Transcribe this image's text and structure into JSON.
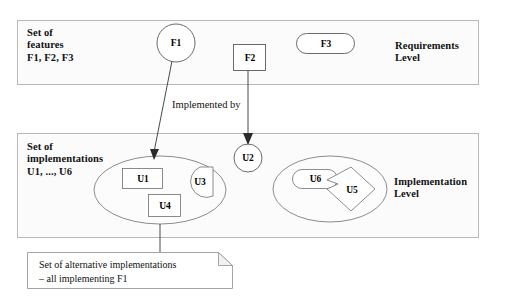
{
  "diagram": {
    "colors": {
      "panel_fill": "#fbfbfb",
      "panel_stroke": "#b8b8b8",
      "shape_stroke": "#5a5a5a",
      "connector": "#4a4a4a",
      "text": "#111111",
      "note_fill": "#ffffff",
      "note_stroke": "#9a9a9a"
    },
    "panels": [
      {
        "id": "requirements",
        "side_label": "Set of\nfeatures\nF1, F2, F3",
        "level_label": "Requirements\nLevel"
      },
      {
        "id": "implementation",
        "side_label": "Set of\nimplementations\nU1, ..., U6",
        "level_label": "Implementation\nLevel"
      }
    ],
    "features": [
      {
        "id": "F1",
        "label": "F1",
        "shape": "circle"
      },
      {
        "id": "F2",
        "label": "F2",
        "shape": "rectangle"
      },
      {
        "id": "F3",
        "label": "F3",
        "shape": "rounded-rectangle"
      }
    ],
    "implementations": [
      {
        "id": "U1",
        "label": "U1",
        "shape": "rectangle"
      },
      {
        "id": "U2",
        "label": "U2",
        "shape": "circle"
      },
      {
        "id": "U3",
        "label": "U3",
        "shape": "cut-circle"
      },
      {
        "id": "U4",
        "label": "U4",
        "shape": "rectangle"
      },
      {
        "id": "U5",
        "label": "U5",
        "shape": "notched-diamond"
      },
      {
        "id": "U6",
        "label": "U6",
        "shape": "rounded-rectangle"
      }
    ],
    "groups": [
      {
        "id": "group-left",
        "members": [
          "U1",
          "U3",
          "U4"
        ]
      },
      {
        "id": "group-right",
        "members": [
          "U6",
          "U5"
        ]
      }
    ],
    "edges": [
      {
        "id": "f1-to-group-left",
        "from": "F1",
        "to": "group-left",
        "arrow": true
      },
      {
        "id": "f2-to-u2",
        "from": "F2",
        "to": "U2",
        "arrow": true
      }
    ],
    "edge_label": "Implemented by",
    "note": {
      "line1": "Set of alternative implementations",
      "line2": "– all implementing F1"
    }
  }
}
